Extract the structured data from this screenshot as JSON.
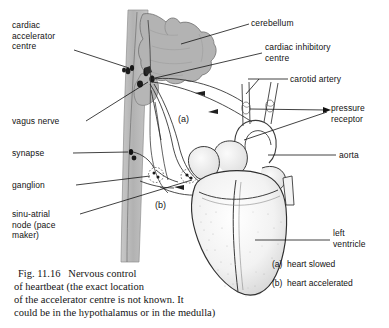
{
  "figure": {
    "background_color": "#ffffff",
    "ink_color": "#121212",
    "brain_fill": "#b3b3b3",
    "cord_fill": "#b9b9b9",
    "heart_fill": "#f3f3f3"
  },
  "labels": {
    "cardiac_accelerator_centre": "cardiac\naccelerator\ncentre",
    "vagus_nerve": "vagus nerve",
    "synapse": "synapse",
    "ganglion": "ganglion",
    "sinu_atrial_node": "sinu-atrial\nnode (pace\nmaker)",
    "cerebellum": "cerebellum",
    "cardiac_inhibitory_centre": "cardiac inhibitory\ncentre",
    "carotid_artery": "carotid artery",
    "pressure_receptor": "pressure\nreceptor",
    "aorta": "aorta",
    "left_ventricle": "left\nventricle"
  },
  "annotations": {
    "a_marker": "(a)",
    "b_marker": "(b)"
  },
  "key": {
    "a_item": "(a)  heart slowed",
    "b_item": "(b)  heart accelerated"
  },
  "caption": {
    "line1": "Fig. 11.16   Nervous control",
    "line2": "of heartbeat (the exact location",
    "line3": "of the accelerator centre is not known. It",
    "line4": "could be in the hypothalamus or in the medulla)"
  }
}
